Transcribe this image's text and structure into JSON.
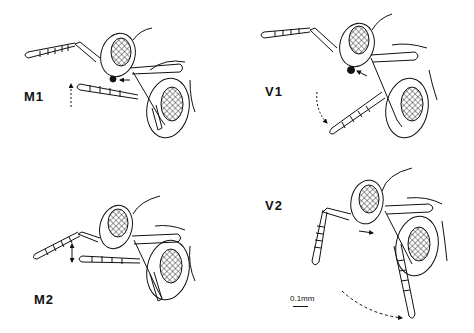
{
  "figure": {
    "panels": [
      {
        "id": "M1",
        "label": "M1"
      },
      {
        "id": "V1",
        "label": "V1"
      },
      {
        "id": "M2",
        "label": "M2"
      },
      {
        "id": "V2",
        "label": "V2"
      }
    ],
    "scale_bar": {
      "label": "0.1mm"
    },
    "colors": {
      "ink": "#111111",
      "background": "#ffffff"
    }
  }
}
